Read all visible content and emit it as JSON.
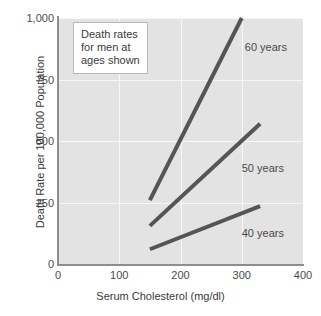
{
  "chart_data": {
    "type": "line",
    "title": "",
    "xlabel": "Serum Cholesterol (mg/dl)",
    "ylabel": "Death Rate per 100,000 Population",
    "xlim": [
      0,
      400
    ],
    "ylim": [
      0,
      1000
    ],
    "xticks": [
      "0",
      "100",
      "200",
      "300",
      "400"
    ],
    "xtick_values": [
      0,
      100,
      200,
      300,
      400
    ],
    "yticks": [
      "0",
      "250",
      "500",
      "750",
      "1,000"
    ],
    "ytick_values": [
      0,
      250,
      500,
      750,
      1000
    ],
    "grid": true,
    "legend_position": "inline-right-of-line",
    "annotation": {
      "line1": "Death rates",
      "line2": "for men at",
      "line3": "ages shown"
    },
    "series": [
      {
        "name": "60 years",
        "label": "60 years",
        "color": "#555555",
        "x": [
          150,
          300
        ],
        "y": [
          260,
          1000
        ],
        "label_x": 305,
        "label_y": 880
      },
      {
        "name": "50 years",
        "label": "50 years",
        "color": "#555555",
        "x": [
          150,
          330
        ],
        "y": [
          155,
          570
        ],
        "label_x": 300,
        "label_y": 385
      },
      {
        "name": "40 years",
        "label": "40 years",
        "color": "#555555",
        "x": [
          150,
          330
        ],
        "y": [
          60,
          235
        ],
        "label_x": 300,
        "label_y": 120
      }
    ]
  },
  "style": {
    "plot_background": "#e3e3e3",
    "page_background": "#ffffff",
    "gridline_color": "#f7f7f7",
    "axis_color": "#8e8e8e",
    "text_color": "#3a3a3a",
    "line_color": "#555555"
  }
}
